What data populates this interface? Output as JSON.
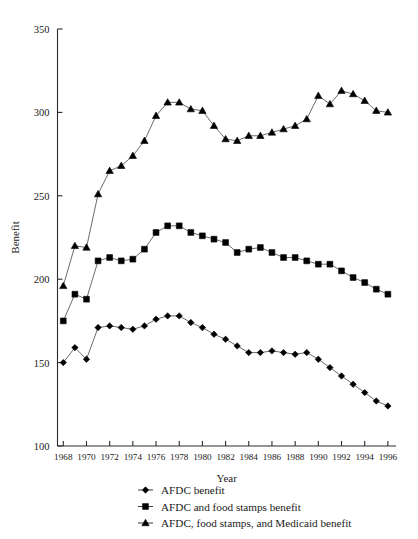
{
  "chart_data": {
    "type": "line",
    "title": "",
    "xlabel": "Year",
    "ylabel": "Benefit",
    "xlim": [
      1967.5,
      1996.5
    ],
    "ylim": [
      100,
      350
    ],
    "yticks": [
      100,
      150,
      200,
      250,
      300,
      350
    ],
    "xticks": [
      1968,
      1970,
      1972,
      1974,
      1976,
      1978,
      1980,
      1982,
      1984,
      1986,
      1988,
      1990,
      1992,
      1994,
      1996
    ],
    "grid": false,
    "legend_position": "below-axis",
    "x": [
      1968,
      1969,
      1970,
      1971,
      1972,
      1973,
      1974,
      1975,
      1976,
      1977,
      1978,
      1979,
      1980,
      1981,
      1982,
      1983,
      1984,
      1985,
      1986,
      1987,
      1988,
      1989,
      1990,
      1991,
      1992,
      1993,
      1994,
      1995,
      1996
    ],
    "series": [
      {
        "name": "AFDC benefit",
        "marker": "diamond",
        "values": [
          150,
          159,
          152,
          171,
          172,
          171,
          170,
          172,
          176,
          178,
          178,
          174,
          171,
          167,
          164,
          160,
          156,
          156,
          157,
          156,
          155,
          156,
          152,
          147,
          142,
          137,
          132,
          127,
          124
        ]
      },
      {
        "name": "AFDC and food stamps benefit",
        "marker": "square",
        "values": [
          175,
          191,
          188,
          211,
          213,
          211,
          212,
          218,
          228,
          232,
          232,
          228,
          226,
          224,
          222,
          216,
          218,
          219,
          216,
          213,
          213,
          211,
          209,
          209,
          205,
          201,
          198,
          194,
          191
        ]
      },
      {
        "name": "AFDC, food stamps, and Medicaid benefit",
        "marker": "triangle",
        "values": [
          196,
          220,
          219,
          251,
          265,
          268,
          274,
          283,
          298,
          306,
          306,
          302,
          301,
          292,
          284,
          283,
          286,
          286,
          288,
          290,
          292,
          296,
          310,
          305,
          313,
          311,
          307,
          301,
          300
        ]
      }
    ]
  },
  "axes": {
    "ylabel": "Benefit",
    "xlabel": "Year",
    "ytick_labels": [
      "350",
      "300",
      "250",
      "200",
      "150",
      "100"
    ],
    "xtick_labels": [
      "1968",
      "1970",
      "1972",
      "1974",
      "1976",
      "1978",
      "1980",
      "1982",
      "1984",
      "1986",
      "1988",
      "1990",
      "1992",
      "1994",
      "1996"
    ]
  },
  "legend": {
    "items": [
      {
        "label": "AFDC benefit",
        "marker": "diamond"
      },
      {
        "label": "AFDC and food stamps benefit",
        "marker": "square"
      },
      {
        "label": "AFDC, food stamps, and Medicaid benefit",
        "marker": "triangle"
      }
    ]
  },
  "colors": {
    "marker": "#000000",
    "line": "#5a5a5a",
    "axis": "#2b2b2b",
    "text": "#1a1a1a",
    "background": "#ffffff"
  }
}
